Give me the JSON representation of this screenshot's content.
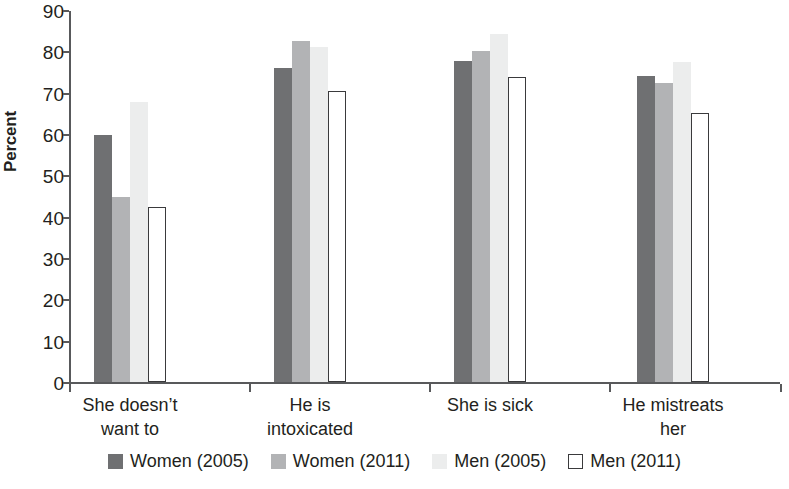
{
  "chart_data": {
    "type": "bar",
    "title": "",
    "xlabel": "",
    "ylabel": "Percent",
    "ylim": [
      0,
      90
    ],
    "yticks": [
      0,
      10,
      20,
      30,
      40,
      50,
      60,
      70,
      80,
      90
    ],
    "grid": false,
    "legend_position": "bottom",
    "categories": [
      "She doesn’t want to",
      "He is intoxicated",
      "She is sick",
      "He mistreats her"
    ],
    "category_lines": [
      [
        "She doesn’t",
        "want to"
      ],
      [
        "He is",
        "intoxicated"
      ],
      [
        "She is sick",
        ""
      ],
      [
        "He mistreats",
        "her"
      ]
    ],
    "series": [
      {
        "name": "Women (2005)",
        "color": "#6f7072",
        "values": [
          59.8,
          76.0,
          77.6,
          74.0
        ]
      },
      {
        "name": "Women (2011)",
        "color": "#b2b3b5",
        "values": [
          44.7,
          82.5,
          80.2,
          72.4
        ]
      },
      {
        "name": "Men (2005)",
        "color": "#eceded",
        "values": [
          67.8,
          81.0,
          84.3,
          77.4
        ]
      },
      {
        "name": "Men (2011)",
        "color": "#ffffff",
        "values": [
          42.3,
          70.5,
          73.8,
          65.0
        ]
      }
    ]
  },
  "legend": {
    "items": [
      {
        "label": "Women (2005)",
        "swatch": "dark-gray-swatch"
      },
      {
        "label": "Women (2011)",
        "swatch": "medium-gray-swatch"
      },
      {
        "label": "Men (2005)",
        "swatch": "light-gray-swatch"
      },
      {
        "label": "Men (2011)",
        "swatch": "white-outline-swatch"
      }
    ]
  }
}
